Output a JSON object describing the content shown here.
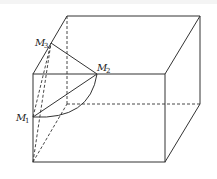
{
  "figure": {
    "type": "geometry-diagram",
    "colors": {
      "stroke": "#333333",
      "background": "#ffffff"
    },
    "labels": {
      "m1": {
        "letter": "M",
        "sub": "1"
      },
      "m2": {
        "letter": "M",
        "sub": "2"
      },
      "m3": {
        "letter": "M",
        "sub": "3"
      }
    },
    "points": {
      "front_top_left": [
        33,
        74
      ],
      "front_top_right": [
        165,
        74
      ],
      "front_bottom_left": [
        33,
        162
      ],
      "front_bottom_right": [
        165,
        162
      ],
      "back_top_left": [
        67,
        16
      ],
      "back_top_right": [
        200,
        16
      ],
      "back_bottom_left": [
        67,
        104
      ],
      "back_bottom_right": [
        200,
        104
      ],
      "M1": [
        33,
        117
      ],
      "M2": [
        97,
        74
      ],
      "M3": [
        51,
        43
      ]
    }
  }
}
